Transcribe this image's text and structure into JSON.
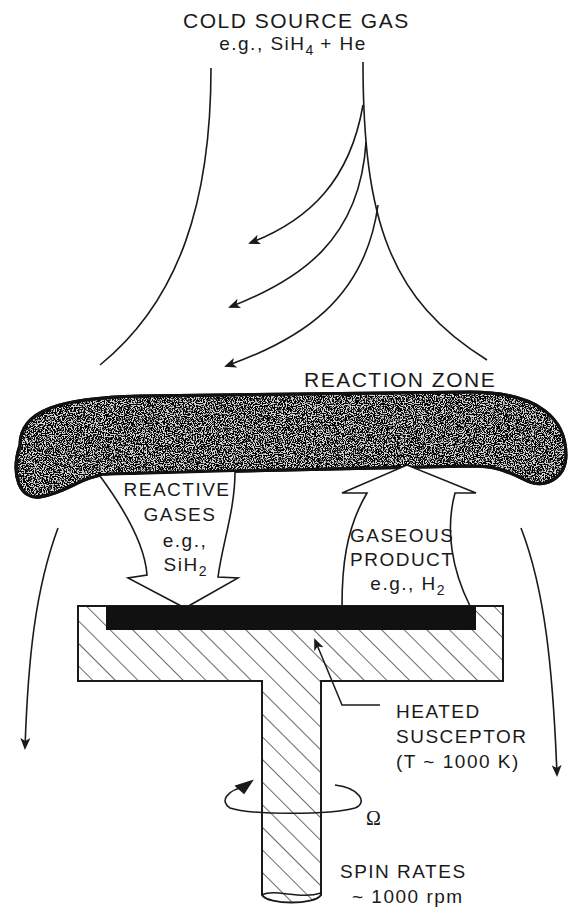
{
  "diagram": {
    "type": "cvd-reactor-schematic",
    "colors": {
      "ink": "#1a1a1a",
      "background": "#ffffff",
      "wafer": "#111111"
    },
    "source_gas": {
      "title": "COLD SOURCE GAS",
      "example_prefix": "e.g., SiH",
      "example_sub": "4",
      "example_suffix": " + He"
    },
    "reaction_zone": {
      "label": "REACTION ZONE"
    },
    "reactive_gases": {
      "line1": "REACTIVE",
      "line2": "GASES",
      "line3": "e.g.,",
      "formula": "SiH",
      "formula_sub": "2"
    },
    "gaseous_product": {
      "line1": "GASEOUS",
      "line2": "PRODUCT",
      "example_prefix": "e.g., H",
      "example_sub": "2"
    },
    "susceptor": {
      "line1": "HEATED",
      "line2": "SUSCEPTOR",
      "line3": "(T ~ 1000 K)"
    },
    "rotation": {
      "symbol": "Ω"
    },
    "spin": {
      "line1": "SPIN RATES",
      "line2": "~ 1000 rpm"
    }
  }
}
